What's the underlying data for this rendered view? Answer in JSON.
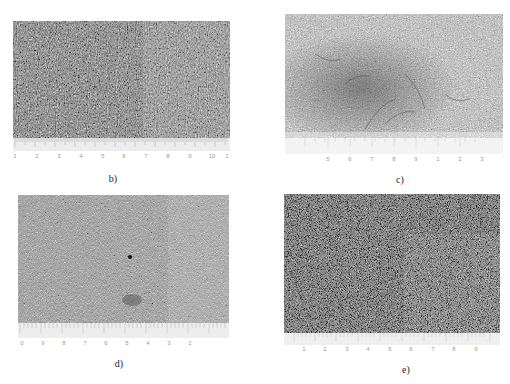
{
  "figure": {
    "panels": [
      {
        "id": "b",
        "caption": "b)",
        "ruler_labels": [
          "1",
          "2",
          "3",
          "4",
          "5",
          "6",
          "7",
          "8",
          "9",
          "10",
          "1"
        ],
        "tone": "#6f6f6f",
        "contrast": "dark-streaky"
      },
      {
        "id": "c",
        "caption": "c)",
        "ruler_labels": [
          "5",
          "6",
          "7",
          "8",
          "9",
          "1",
          "2",
          "3"
        ],
        "tone": "#a8a8a8",
        "contrast": "light-fibrous"
      },
      {
        "id": "d",
        "caption": "d)",
        "ruler_labels": [
          "0",
          "9",
          "8",
          "7",
          "6",
          "5",
          "4",
          "3",
          "2"
        ],
        "tone": "#808080",
        "contrast": "medium-fine"
      },
      {
        "id": "e",
        "caption": "e)",
        "ruler_labels": [
          "1",
          "2",
          "3",
          "4",
          "5",
          "6",
          "7",
          "8",
          "9"
        ],
        "tone": "#5e5e5e",
        "contrast": "dark-granular"
      }
    ]
  }
}
